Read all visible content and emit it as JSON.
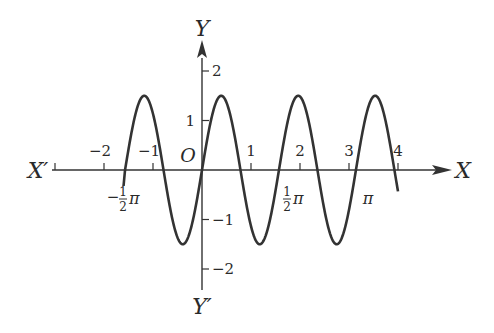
{
  "chart_data": {
    "type": "line",
    "title": "",
    "function": "y = 1.5 sin(4x)",
    "xlabel": "X",
    "xlabel_neg": "X′",
    "ylabel": "Y",
    "ylabel_neg": "Y′",
    "origin_label": "O",
    "xlim": [
      -3,
      4.2
    ],
    "ylim": [
      -2.4,
      2.5
    ],
    "x_ticks": [
      -3,
      -2,
      -1,
      1,
      2,
      3,
      4
    ],
    "x_tick_labels": [
      "",
      "−2",
      "−1",
      "1",
      "2",
      "3",
      "4"
    ],
    "y_ticks": [
      2,
      1,
      -1,
      -2
    ],
    "y_tick_labels": [
      "2",
      "1",
      "−1",
      "−2"
    ],
    "annotations": [
      {
        "text": "−½π",
        "x": -1.5708
      },
      {
        "text": "½π",
        "x": 1.5708
      },
      {
        "text": "π",
        "x": 3.1416
      }
    ],
    "series": [
      {
        "name": "curve",
        "x_start": -1.5708,
        "x_end": 4.0,
        "amplitude": 1.5,
        "angular_frequency": 4,
        "x": [
          -1.571,
          -1.178,
          -0.785,
          -0.393,
          0,
          0.393,
          0.785,
          1.178,
          1.571,
          1.963,
          2.356,
          2.749,
          3.142,
          3.534,
          3.927,
          4.0
        ],
        "y": [
          0,
          1.5,
          0,
          -1.5,
          0,
          1.5,
          0,
          -1.5,
          0,
          1.5,
          0,
          -1.5,
          0,
          1.5,
          0,
          -0.43
        ]
      }
    ],
    "grid": false,
    "legend": "none"
  }
}
